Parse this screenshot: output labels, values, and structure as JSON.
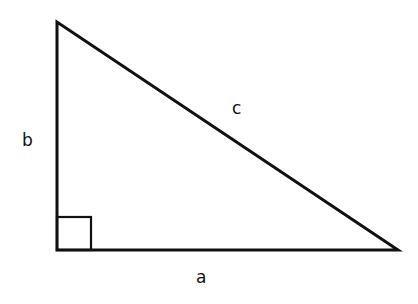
{
  "diagram": {
    "type": "right-triangle",
    "stroke_color": "#111111",
    "background": "#ffffff",
    "vertices": {
      "top": [
        57,
        22
      ],
      "right_angle": [
        57,
        250
      ],
      "right": [
        398,
        250
      ]
    },
    "right_angle_marker_size": 34,
    "labels": {
      "a": "a",
      "b": "b",
      "c": "c"
    }
  }
}
